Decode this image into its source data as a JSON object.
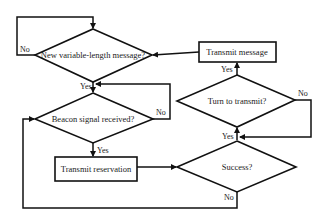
{
  "diagram": {
    "type": "flowchart",
    "colors": {
      "line": "#111111",
      "background": "#ffffff",
      "text": "#1a1a1a"
    },
    "nodes": [
      {
        "id": "new_msg",
        "shape": "diamond",
        "label": "New variable-length message?"
      },
      {
        "id": "beacon",
        "shape": "diamond",
        "label": "Beacon signal received?"
      },
      {
        "id": "tx_reservation",
        "shape": "rectangle",
        "label": "Transmit reservation"
      },
      {
        "id": "success",
        "shape": "diamond",
        "label": "Success?"
      },
      {
        "id": "turn",
        "shape": "diamond",
        "label": "Turn to transmit?"
      },
      {
        "id": "tx_message",
        "shape": "rectangle",
        "label": "Transmit message"
      }
    ],
    "edge_labels": {
      "new_msg_no": "No",
      "new_msg_yes": "Yes",
      "beacon_no": "No",
      "beacon_yes": "Yes",
      "success_yes": "Yes",
      "success_no": "No",
      "turn_yes": "Yes",
      "turn_no": "No"
    },
    "edges": [
      {
        "from": "new_msg",
        "to": "new_msg",
        "label": "No"
      },
      {
        "from": "new_msg",
        "to": "beacon",
        "label": "Yes"
      },
      {
        "from": "beacon",
        "to": "beacon",
        "label": "No"
      },
      {
        "from": "beacon",
        "to": "tx_reservation",
        "label": "Yes"
      },
      {
        "from": "tx_reservation",
        "to": "success",
        "label": ""
      },
      {
        "from": "success",
        "to": "turn",
        "label": "Yes"
      },
      {
        "from": "success",
        "to": "beacon",
        "label": "No"
      },
      {
        "from": "turn",
        "to": "tx_message",
        "label": "Yes"
      },
      {
        "from": "turn",
        "to": "turn",
        "label": "No"
      },
      {
        "from": "tx_message",
        "to": "new_msg",
        "label": ""
      }
    ]
  }
}
